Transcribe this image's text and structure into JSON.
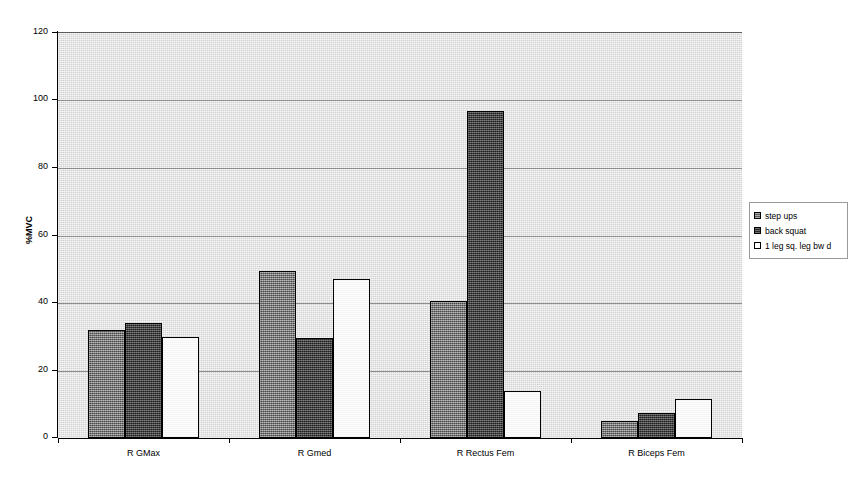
{
  "chart_data": {
    "type": "bar",
    "title": "",
    "xlabel": "",
    "ylabel": "%MVC",
    "ylim": [
      0,
      120
    ],
    "yticks": [
      0,
      20,
      40,
      60,
      80,
      100,
      120
    ],
    "ytick_labels": [
      "0",
      "20",
      "40",
      "60",
      "80",
      "100",
      "120"
    ],
    "grid": true,
    "legend_position": "right",
    "categories": [
      "R GMax",
      "R Gmed",
      "R Rectus Fem",
      "R Biceps Fem"
    ],
    "series": [
      {
        "name": "step ups",
        "color": "#7b7b7b",
        "values": [
          32,
          49.5,
          40.5,
          5
        ]
      },
      {
        "name": "back squat",
        "color": "#3b3b3b",
        "values": [
          34,
          29.5,
          97,
          7.5
        ]
      },
      {
        "name": "1 leg sq. leg bw d",
        "color": "#ffffff",
        "values": [
          30,
          47,
          14,
          11.5
        ]
      }
    ]
  },
  "axes": {
    "y_axis_title": "%MVC",
    "y_labels": [
      "120",
      "100",
      "80",
      "60",
      "40",
      "20",
      "0"
    ],
    "x_labels": [
      "R GMax",
      "R Gmed",
      "R Rectus Fem",
      "R Biceps Fem"
    ]
  },
  "legend": {
    "items": [
      {
        "label": "step ups"
      },
      {
        "label": "back squat"
      },
      {
        "label": "1 leg sq. leg bw d"
      }
    ]
  },
  "colors": {
    "plot_background": "#d2d2d2",
    "gridline": "#8d8d8d",
    "axis": "#000000",
    "series_1": "#7b7b7b",
    "series_2": "#3b3b3b",
    "series_3": "#ffffff"
  }
}
